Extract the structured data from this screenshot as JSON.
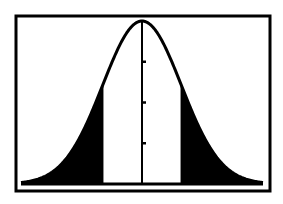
{
  "chart_data": {
    "type": "area",
    "title": "",
    "subtitle": "",
    "xlabel": "",
    "ylabel": "",
    "distribution": {
      "name": "normal",
      "mean": 0,
      "sd": 1
    },
    "x_range": [
      -3.1,
      3.1
    ],
    "shaded_regions": [
      {
        "from": -3.1,
        "to": -1.0,
        "label": "left tail"
      },
      {
        "from": 1.0,
        "to": 3.1,
        "label": "right tail"
      }
    ],
    "unshaded_region": {
      "from": -1.0,
      "to": 1.0
    },
    "y_axis": {
      "position_x": 0,
      "tick_count": 3
    },
    "grid": false,
    "legend": null,
    "colors": {
      "curve": "#000000",
      "fill": "#000000",
      "background": "#ffffff",
      "frame": "#000000"
    }
  },
  "frame": {
    "x": 16,
    "y": 16,
    "width": 254,
    "height": 175
  },
  "plot": {
    "center_x": 142,
    "baseline_y": 184,
    "peak_y": 21,
    "sigma_px": 39.3,
    "x_start": 21,
    "x_end": 263
  }
}
